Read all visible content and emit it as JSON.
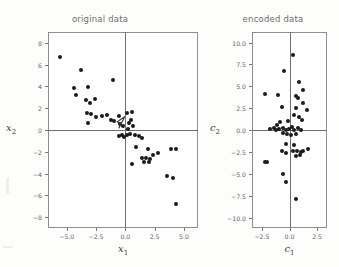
{
  "figure": {
    "background_color": "#fdfdfc",
    "point_color": "#1a1a1a",
    "frame_color": "#8e8e8e",
    "axis_color": "#6f6f6f"
  },
  "chart_data": [
    {
      "type": "scatter",
      "title": "original data",
      "xlabel": "x",
      "xlabel_sub": "1",
      "ylabel": "x",
      "ylabel_sub": "2",
      "xlim": [
        -6.6,
        6.2
      ],
      "ylim": [
        -9.0,
        9.0
      ],
      "xticks": [
        -5.0,
        -2.5,
        0.0,
        2.5,
        5.0
      ],
      "xticklabels": [
        "-5.0",
        "-2.5",
        "0.0",
        "2.5",
        "5.0"
      ],
      "yticks": [
        8,
        6,
        4,
        2,
        0,
        -2,
        -4,
        -6,
        -8
      ],
      "yticklabels": [
        "8",
        "6",
        "4",
        "2",
        "0",
        "-2",
        "-4",
        "-6",
        "-8"
      ],
      "grid": false,
      "legend": "none",
      "axis_lines_at_zero": true,
      "points": [
        [
          -5.55,
          6.75
        ],
        [
          -3.75,
          5.5
        ],
        [
          -4.35,
          3.85
        ],
        [
          -4.2,
          3.25
        ],
        [
          -3.15,
          3.95
        ],
        [
          -3.35,
          2.75
        ],
        [
          -3.05,
          2.45
        ],
        [
          -2.6,
          2.85
        ],
        [
          -3.3,
          1.55
        ],
        [
          -2.95,
          1.5
        ],
        [
          -2.5,
          1.15
        ],
        [
          -3.15,
          0.65
        ],
        [
          -2.0,
          1.25
        ],
        [
          -1.55,
          1.35
        ],
        [
          -1.2,
          0.95
        ],
        [
          -1.05,
          4.6
        ],
        [
          -0.95,
          0.8
        ],
        [
          -0.55,
          1.3
        ],
        [
          -0.45,
          0.55
        ],
        [
          -0.2,
          0.35
        ],
        [
          0.15,
          1.55
        ],
        [
          0.55,
          1.65
        ],
        [
          0.45,
          0.9
        ],
        [
          0.3,
          0.6
        ],
        [
          0.65,
          0.35
        ],
        [
          0.25,
          0.05
        ],
        [
          -0.3,
          -0.45
        ],
        [
          -0.5,
          -0.55
        ],
        [
          -0.15,
          -0.6
        ],
        [
          0.1,
          -0.5
        ],
        [
          0.4,
          -0.35
        ],
        [
          0.85,
          -0.45
        ],
        [
          1.2,
          -0.55
        ],
        [
          1.45,
          -0.75
        ],
        [
          0.9,
          -1.6
        ],
        [
          1.9,
          -1.75
        ],
        [
          2.35,
          -2.25
        ],
        [
          2.75,
          -2.1
        ],
        [
          3.9,
          -1.7
        ],
        [
          4.3,
          -1.75
        ],
        [
          1.4,
          -2.55
        ],
        [
          1.75,
          -2.6
        ],
        [
          2.1,
          -2.7
        ],
        [
          1.55,
          -2.95
        ],
        [
          2.0,
          -2.95
        ],
        [
          0.55,
          -3.1
        ],
        [
          3.55,
          -4.25
        ],
        [
          4.1,
          -4.45
        ],
        [
          4.35,
          -6.8
        ]
      ]
    },
    {
      "type": "scatter",
      "title": "encoded data",
      "xlabel": "c",
      "xlabel_sub": "1",
      "ylabel": "c",
      "ylabel_sub": "2",
      "xlim": [
        -3.4,
        3.4
      ],
      "ylim": [
        -11.2,
        11.2
      ],
      "xticks": [
        -2.5,
        0.0,
        2.5
      ],
      "xticklabels": [
        "-2.5",
        "0.0",
        "2.5"
      ],
      "yticks": [
        10.0,
        7.5,
        5.0,
        2.5,
        0.0,
        -2.5,
        -5.0,
        -7.5,
        -10.0
      ],
      "yticklabels": [
        "10.0",
        "7.5",
        "5.0",
        "2.5",
        "0.0",
        "-2.5",
        "-5.0",
        "-7.5",
        "-10.0"
      ],
      "grid": false,
      "legend": "none",
      "axis_lines_at_zero": true,
      "points": [
        [
          0.35,
          8.6
        ],
        [
          -0.5,
          6.7
        ],
        [
          0.9,
          5.45
        ],
        [
          1.25,
          4.55
        ],
        [
          -2.2,
          4.1
        ],
        [
          -1.0,
          4.0
        ],
        [
          0.55,
          3.9
        ],
        [
          0.8,
          3.7
        ],
        [
          1.2,
          3.1
        ],
        [
          -0.7,
          2.6
        ],
        [
          0.55,
          2.55
        ],
        [
          1.55,
          2.3
        ],
        [
          0.4,
          1.75
        ],
        [
          0.85,
          1.5
        ],
        [
          1.1,
          1.1
        ],
        [
          -0.15,
          1.05
        ],
        [
          -0.85,
          0.9
        ],
        [
          -1.1,
          0.55
        ],
        [
          -1.45,
          0.25
        ],
        [
          -1.75,
          0.1
        ],
        [
          -1.2,
          -0.05
        ],
        [
          -0.95,
          0.15
        ],
        [
          -0.6,
          0.2
        ],
        [
          -0.35,
          0.0
        ],
        [
          -0.05,
          0.15
        ],
        [
          0.2,
          0.3
        ],
        [
          0.45,
          0.05
        ],
        [
          0.75,
          0.2
        ],
        [
          1.05,
          0.05
        ],
        [
          -0.55,
          -0.35
        ],
        [
          -0.2,
          -0.45
        ],
        [
          0.15,
          -0.55
        ],
        [
          0.55,
          -0.45
        ],
        [
          -0.35,
          -1.6
        ],
        [
          0.4,
          -1.75
        ],
        [
          -0.65,
          -2.35
        ],
        [
          -0.35,
          -2.6
        ],
        [
          0.35,
          -2.45
        ],
        [
          0.7,
          -2.4
        ],
        [
          1.0,
          -2.5
        ],
        [
          1.25,
          -2.35
        ],
        [
          1.7,
          -2.2
        ],
        [
          0.6,
          -2.95
        ],
        [
          0.95,
          -2.9
        ],
        [
          -2.25,
          -3.6
        ],
        [
          -2.05,
          -3.65
        ],
        [
          -0.55,
          -5.05
        ],
        [
          -0.35,
          -5.9
        ],
        [
          0.55,
          -7.9
        ]
      ]
    }
  ],
  "annotations": {
    "cursor_arrow": {
      "name": "cursor-arrow",
      "panel": "original data",
      "x": -0.3,
      "y": 0.55
    }
  }
}
